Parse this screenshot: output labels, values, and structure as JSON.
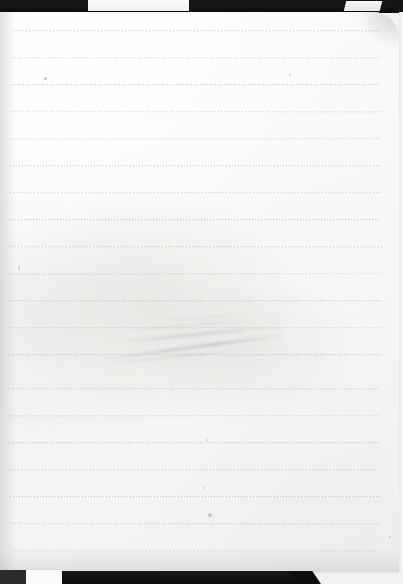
{
  "document": {
    "kind": "scanned-notebook-page",
    "title": "Blank ruled notebook page",
    "visible_text": "",
    "page_width": 403,
    "page_height": 584
  },
  "paper": {
    "label": "notebook-paper",
    "color": "#fbfbfa",
    "left": 0,
    "top": 12,
    "width": 399,
    "height": 560,
    "corner_radius_top_right": 26
  },
  "scanner_background": {
    "label": "scanner-bed",
    "color": "#0d0d0e",
    "top_strip_height": 13,
    "bottom_bar": {
      "left": 62,
      "top": 571,
      "width": 249,
      "height": 13
    },
    "bottom_left_block": {
      "left": 0,
      "top": 570,
      "width": 26,
      "height": 14
    },
    "highlights": [
      {
        "name": "bed-highlight-left",
        "left": 88,
        "top": 0,
        "width": 101,
        "height": 11,
        "color": "#f6f6f4"
      },
      {
        "name": "bed-highlight-right",
        "left": 345,
        "top": 1,
        "width": 36,
        "height": 10,
        "color": "#f9f9f7"
      }
    ]
  },
  "ruling": {
    "label": "dotted-ruled-lines",
    "style": "dotted",
    "color": "#969aa0",
    "line_spacing": 27,
    "first_line_y": 30,
    "line_left": 10,
    "line_right": 382,
    "count": 20,
    "lines": [
      {
        "index": 1,
        "y": 30,
        "left": 14,
        "width": 366
      },
      {
        "index": 2,
        "y": 57,
        "left": 12,
        "width": 368
      },
      {
        "index": 3,
        "y": 84,
        "left": 11,
        "width": 369
      },
      {
        "index": 4,
        "y": 111,
        "left": 11,
        "width": 370
      },
      {
        "index": 5,
        "y": 138,
        "left": 10,
        "width": 371
      },
      {
        "index": 6,
        "y": 165,
        "left": 10,
        "width": 371
      },
      {
        "index": 7,
        "y": 192,
        "left": 10,
        "width": 372
      },
      {
        "index": 8,
        "y": 219,
        "left": 9,
        "width": 372
      },
      {
        "index": 9,
        "y": 246,
        "left": 9,
        "width": 373
      },
      {
        "index": 10,
        "y": 273,
        "left": 9,
        "width": 373
      },
      {
        "index": 11,
        "y": 300,
        "left": 8,
        "width": 373
      },
      {
        "index": 12,
        "y": 327,
        "left": 8,
        "width": 373
      },
      {
        "index": 13,
        "y": 354,
        "left": 8,
        "width": 373
      },
      {
        "index": 14,
        "y": 388,
        "left": 8,
        "width": 372
      },
      {
        "index": 15,
        "y": 415,
        "left": 8,
        "width": 372
      },
      {
        "index": 16,
        "y": 442,
        "left": 8,
        "width": 372
      },
      {
        "index": 17,
        "y": 469,
        "left": 9,
        "width": 371
      },
      {
        "index": 18,
        "y": 496,
        "left": 10,
        "width": 370
      },
      {
        "index": 19,
        "y": 523,
        "left": 12,
        "width": 368
      },
      {
        "index": 20,
        "y": 550,
        "left": 14,
        "width": 364
      }
    ]
  },
  "artifacts": {
    "label": "paper-artifacts",
    "smudge": {
      "name": "diagonal-crease-smudge",
      "description": "faint diagonal pencil smudge / crease across middle of page",
      "approx_x": 96,
      "approx_y": 305,
      "approx_width": 195,
      "approx_height": 45
    },
    "specks": [
      {
        "name": "speck-upper-left",
        "x": 44,
        "y": 65
      },
      {
        "name": "speck-lower-center",
        "x": 208,
        "y": 501
      },
      {
        "name": "speck-upper-right",
        "x": 289,
        "y": 62
      },
      {
        "name": "speck-mid-center",
        "x": 206,
        "y": 427
      },
      {
        "name": "speck-low-center",
        "x": 203,
        "y": 475
      },
      {
        "name": "speck-right-edge",
        "x": 389,
        "y": 524
      },
      {
        "name": "speck-left-edge",
        "x": 18,
        "y": 253
      }
    ]
  }
}
